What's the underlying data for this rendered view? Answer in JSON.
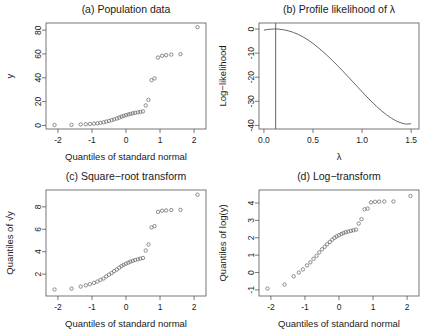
{
  "figure": {
    "panels": [
      "a",
      "b",
      "c",
      "d"
    ]
  },
  "chart_data": [
    {
      "id": "a",
      "type": "scatter",
      "title": "(a) Population data",
      "xlabel": "Quantiles of standard normal",
      "ylabel": "y",
      "xlim": [
        -2.35,
        2.35
      ],
      "ylim": [
        -3,
        86
      ],
      "xticks": [
        -2,
        -1,
        0,
        1,
        2
      ],
      "xticklabels": [
        "-2",
        "-1",
        "0",
        "1",
        "2"
      ],
      "yticks": [
        0,
        20,
        40,
        60,
        80
      ],
      "yticklabels": [
        "0",
        "20",
        "40",
        "60",
        "80"
      ],
      "grid": false,
      "marker": "open-circle",
      "x": [
        -2.1,
        -1.6,
        -1.33,
        -1.18,
        -1.06,
        -0.94,
        -0.84,
        -0.75,
        -0.66,
        -0.58,
        -0.5,
        -0.42,
        -0.35,
        -0.27,
        -0.2,
        -0.13,
        -0.07,
        0.0,
        0.07,
        0.13,
        0.2,
        0.27,
        0.35,
        0.42,
        0.5,
        0.58,
        0.66,
        0.75,
        0.84,
        0.94,
        1.06,
        1.18,
        1.33,
        1.6,
        2.1
      ],
      "y": [
        0.4,
        0.5,
        0.8,
        1.0,
        1.2,
        1.5,
        1.8,
        2.2,
        2.6,
        3.2,
        3.8,
        4.4,
        5.1,
        5.8,
        6.6,
        7.4,
        8.0,
        8.6,
        9.2,
        9.7,
        10.2,
        10.6,
        11.0,
        11.4,
        11.8,
        16.8,
        21.5,
        38.0,
        39.5,
        57.0,
        58.5,
        59.0,
        59.5,
        59.8,
        82.5
      ]
    },
    {
      "id": "b",
      "type": "line",
      "title": "(b) Profile likelihood of λ",
      "xlabel": "λ",
      "ylabel": "Log−likelihood",
      "xlim": [
        -0.05,
        1.58
      ],
      "ylim": [
        -41.5,
        2.5
      ],
      "xticks": [
        0.0,
        0.5,
        1.0,
        1.5
      ],
      "xticklabels": [
        "0.0",
        "0.5",
        "1.0",
        "1.5"
      ],
      "yticks": [
        0,
        -10,
        -20,
        -30,
        -40
      ],
      "yticklabels": [
        "0",
        "-10",
        "-20",
        "-30",
        "-40"
      ],
      "grid": false,
      "mle_lambda": 0.12,
      "vline_at": 0.12,
      "x": [
        0.0,
        0.05,
        0.1,
        0.12,
        0.15,
        0.2,
        0.25,
        0.3,
        0.35,
        0.4,
        0.45,
        0.5,
        0.55,
        0.6,
        0.65,
        0.7,
        0.75,
        0.8,
        0.85,
        0.9,
        0.95,
        1.0,
        1.05,
        1.1,
        1.15,
        1.2,
        1.25,
        1.3,
        1.35,
        1.4,
        1.45,
        1.5
      ],
      "y": [
        -0.45,
        -0.12,
        -0.01,
        0.0,
        -0.05,
        -0.3,
        -0.75,
        -1.4,
        -2.25,
        -3.3,
        -4.55,
        -6.0,
        -7.6,
        -9.35,
        -11.2,
        -13.15,
        -15.2,
        -17.3,
        -19.45,
        -21.65,
        -23.85,
        -26.05,
        -28.2,
        -30.25,
        -32.2,
        -34.0,
        -35.65,
        -37.05,
        -38.2,
        -39.0,
        -39.5,
        -39.3
      ]
    },
    {
      "id": "c",
      "type": "scatter",
      "title": "(c) Square−root transform",
      "xlabel": "Quantiles of standard normal",
      "ylabel": "Quantiles of √y",
      "xlim": [
        -2.35,
        2.35
      ],
      "ylim": [
        0.05,
        9.5
      ],
      "xticks": [
        -2,
        -1,
        0,
        1,
        2
      ],
      "xticklabels": [
        "-2",
        "-1",
        "0",
        "1",
        "2"
      ],
      "yticks": [
        2,
        4,
        6,
        8
      ],
      "yticklabels": [
        "2",
        "4",
        "6",
        "8"
      ],
      "grid": false,
      "marker": "open-circle",
      "x": [
        -2.1,
        -1.6,
        -1.33,
        -1.18,
        -1.06,
        -0.94,
        -0.84,
        -0.75,
        -0.66,
        -0.58,
        -0.5,
        -0.42,
        -0.35,
        -0.27,
        -0.2,
        -0.13,
        -0.07,
        0.0,
        0.07,
        0.13,
        0.2,
        0.27,
        0.35,
        0.42,
        0.5,
        0.58,
        0.66,
        0.75,
        0.84,
        0.94,
        1.06,
        1.18,
        1.33,
        1.6,
        2.1
      ],
      "y": [
        0.63,
        0.71,
        0.89,
        1.0,
        1.1,
        1.22,
        1.34,
        1.48,
        1.61,
        1.79,
        1.95,
        2.1,
        2.26,
        2.41,
        2.57,
        2.72,
        2.83,
        2.93,
        3.03,
        3.11,
        3.19,
        3.26,
        3.32,
        3.38,
        3.44,
        4.1,
        4.64,
        6.16,
        6.28,
        7.55,
        7.65,
        7.68,
        7.71,
        7.73,
        9.08
      ]
    },
    {
      "id": "d",
      "type": "scatter",
      "title": "(d) Log−transform",
      "xlabel": "Quantiles of standard normal",
      "ylabel": "Quantiles of log(y)",
      "xlim": [
        -2.35,
        2.35
      ],
      "ylim": [
        -1.35,
        4.75
      ],
      "xticks": [
        -2,
        -1,
        0,
        1,
        2
      ],
      "xticklabels": [
        "-2",
        "-1",
        "0",
        "1",
        "2"
      ],
      "yticks": [
        -1,
        0,
        1,
        2,
        3,
        4
      ],
      "yticklabels": [
        "-1",
        "0",
        "1",
        "2",
        "3",
        "4"
      ],
      "grid": false,
      "marker": "open-circle",
      "x": [
        -2.1,
        -1.6,
        -1.33,
        -1.18,
        -1.06,
        -0.94,
        -0.84,
        -0.75,
        -0.66,
        -0.58,
        -0.5,
        -0.42,
        -0.35,
        -0.27,
        -0.2,
        -0.13,
        -0.07,
        0.0,
        0.07,
        0.13,
        0.2,
        0.27,
        0.35,
        0.42,
        0.5,
        0.58,
        0.66,
        0.75,
        0.84,
        0.94,
        1.06,
        1.18,
        1.33,
        1.6,
        2.1
      ],
      "y": [
        -0.92,
        -0.69,
        -0.22,
        0.0,
        0.18,
        0.41,
        0.59,
        0.79,
        0.96,
        1.16,
        1.34,
        1.48,
        1.63,
        1.76,
        1.89,
        2.0,
        2.08,
        2.15,
        2.22,
        2.27,
        2.32,
        2.36,
        2.4,
        2.43,
        2.47,
        2.82,
        3.07,
        3.64,
        3.68,
        4.04,
        4.07,
        4.08,
        4.09,
        4.09,
        4.41
      ]
    }
  ]
}
